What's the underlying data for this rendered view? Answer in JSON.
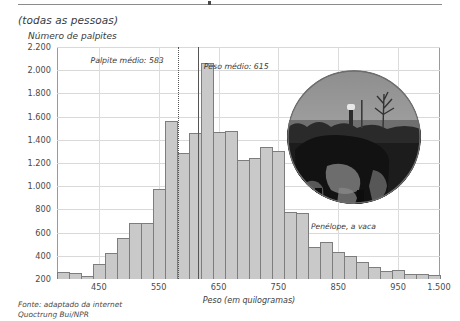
{
  "figure": {
    "subtitle": "(todas as pessoas)",
    "y_axis_label": "Número de palpites",
    "x_axis_label": "Peso (em quilogramas)",
    "source_line1": "Fonte: adaptado da internet",
    "source_line2": "Quoctrung Bui/NPR",
    "photo_caption": "Penélope, a vaca",
    "photo_alt": "fotografia circular de uma vaca num pasto"
  },
  "annotations": [
    {
      "id": "mean-guess",
      "label": "Palpite médio: 583",
      "value": 583,
      "style": "dotted"
    },
    {
      "id": "true-weight",
      "label": "Peso médio: 615",
      "value": 615,
      "style": "solid"
    }
  ],
  "colors": {
    "bar_fill": "#c9c9c9",
    "bar_stroke": "#7d7d7d",
    "gridline": "#d9d9d9",
    "axis": "#6e6e6e",
    "text": "#3a3a3a"
  },
  "chart_data": {
    "type": "bar",
    "title": "(todas as pessoas)",
    "xlabel": "Peso (em quilogramas)",
    "ylabel": "Número de palpites",
    "xlim": [
      380,
      1020
    ],
    "ylim": [
      200,
      2200
    ],
    "grid": true,
    "legend": "none",
    "x_ticks": [
      450,
      550,
      650,
      750,
      850,
      950,
      1500
    ],
    "x_tick_labels": [
      "450",
      "550",
      "650",
      "750",
      "850",
      "950",
      "1.500"
    ],
    "y_ticks": [
      200,
      400,
      600,
      800,
      1000,
      1200,
      1400,
      1600,
      1800,
      2000,
      2200
    ],
    "y_tick_labels": [
      "200",
      "400",
      "600",
      "800",
      "1.000",
      "1.200",
      "1.400",
      "1.600",
      "1.800",
      "2.000",
      "2.200"
    ],
    "bin_width": 20,
    "note": "último intervalo comprimido representa valores até 1.500",
    "categories": [
      380,
      400,
      420,
      440,
      460,
      480,
      500,
      520,
      540,
      560,
      580,
      600,
      620,
      640,
      660,
      680,
      700,
      720,
      740,
      760,
      780,
      800,
      820,
      840,
      860,
      880,
      900,
      920,
      940,
      960,
      980,
      1000
    ],
    "values": [
      260,
      255,
      225,
      330,
      420,
      555,
      680,
      680,
      975,
      1560,
      1290,
      1460,
      2060,
      1470,
      1480,
      1230,
      1245,
      1340,
      1300,
      780,
      770,
      480,
      520,
      430,
      400,
      350,
      300,
      265,
      280,
      245,
      240,
      235
    ],
    "annotations": [
      {
        "label": "Palpite médio: 583",
        "x": 583
      },
      {
        "label": "Peso médio: 615",
        "x": 615
      }
    ]
  }
}
